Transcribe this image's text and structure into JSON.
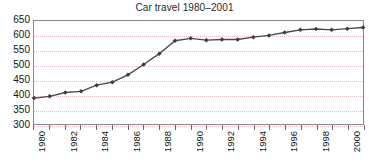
{
  "chart_data": {
    "type": "line",
    "title": "Car travel 1980–2001",
    "xlabel": "",
    "ylabel": "",
    "ylim": [
      300,
      650
    ],
    "ytick_step": 50,
    "yticks": [
      650,
      600,
      550,
      500,
      450,
      400,
      350,
      300
    ],
    "grid": true,
    "legend": "none",
    "xlim": [
      1980,
      2001
    ],
    "xtick_labels_shown": [
      "1980",
      "1982",
      "1984",
      "1986",
      "1988",
      "1990",
      "1992",
      "1994",
      "1996",
      "1998",
      "2000"
    ],
    "x": [
      1980,
      1981,
      1982,
      1983,
      1984,
      1985,
      1986,
      1987,
      1988,
      1989,
      1990,
      1991,
      1992,
      1993,
      1994,
      1995,
      1996,
      1997,
      1998,
      1999,
      2000,
      2001
    ],
    "values": [
      388,
      394,
      407,
      411,
      432,
      442,
      467,
      502,
      539,
      583,
      591,
      585,
      587,
      587,
      595,
      601,
      611,
      620,
      623,
      620,
      624,
      628
    ],
    "series_name": "Car travel",
    "line_color": "#4a4a4a",
    "marker": "diamond",
    "marker_color": "#3d3d3d",
    "grid_color": "#e8b9bb",
    "axis_color": "#8a8a8a"
  }
}
